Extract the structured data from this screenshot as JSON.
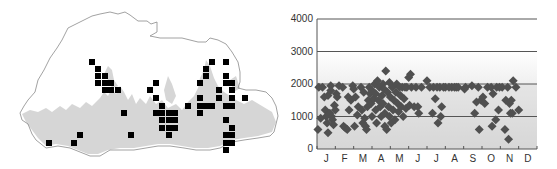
{
  "map": {
    "outline_color": "#8a8a8a",
    "forest_color": "#d6d6d6",
    "marker_color": "#000000",
    "marker_size": 6,
    "records": [
      [
        92,
        62
      ],
      [
        98,
        69
      ],
      [
        98,
        76
      ],
      [
        105,
        76
      ],
      [
        98,
        83
      ],
      [
        105,
        83
      ],
      [
        111,
        83
      ],
      [
        105,
        90
      ],
      [
        111,
        90
      ],
      [
        118,
        90
      ],
      [
        124,
        113
      ],
      [
        131,
        135
      ],
      [
        80,
        135
      ],
      [
        74,
        143
      ],
      [
        49,
        143
      ],
      [
        156,
        83
      ],
      [
        150,
        90
      ],
      [
        156,
        98
      ],
      [
        162,
        106
      ],
      [
        156,
        113
      ],
      [
        162,
        113
      ],
      [
        169,
        113
      ],
      [
        175,
        113
      ],
      [
        162,
        120
      ],
      [
        169,
        120
      ],
      [
        175,
        120
      ],
      [
        162,
        128
      ],
      [
        169,
        128
      ],
      [
        175,
        128
      ],
      [
        169,
        135
      ],
      [
        188,
        106
      ],
      [
        212,
        62
      ],
      [
        226,
        62
      ],
      [
        206,
        69
      ],
      [
        206,
        76
      ],
      [
        226,
        76
      ],
      [
        200,
        83
      ],
      [
        226,
        83
      ],
      [
        232,
        83
      ],
      [
        219,
        90
      ],
      [
        232,
        90
      ],
      [
        200,
        98
      ],
      [
        219,
        98
      ],
      [
        232,
        98
      ],
      [
        245,
        98
      ],
      [
        200,
        106
      ],
      [
        206,
        106
      ],
      [
        212,
        106
      ],
      [
        226,
        106
      ],
      [
        232,
        106
      ],
      [
        200,
        113
      ],
      [
        226,
        120
      ],
      [
        232,
        128
      ],
      [
        226,
        135
      ],
      [
        232,
        135
      ],
      [
        226,
        143
      ],
      [
        232,
        143
      ],
      [
        226,
        150
      ]
    ]
  },
  "chart_data": {
    "type": "scatter",
    "title": "",
    "xlabel": "",
    "ylabel": "",
    "categories": [
      "J",
      "F",
      "M",
      "A",
      "M",
      "J",
      "J",
      "A",
      "S",
      "O",
      "N",
      "D"
    ],
    "yticks": [
      0,
      1000,
      2000,
      3000,
      4000
    ],
    "ylim": [
      0,
      4000
    ],
    "xlim": [
      0,
      12
    ],
    "grid": {
      "y": [
        1000,
        2000,
        3000,
        4000
      ],
      "color": "#555555"
    },
    "background_gradient": {
      "top": "#ffffff",
      "bottom": "#d0d0d0",
      "from_value": 3000
    },
    "band_below_2000": "#dcdcdc",
    "marker": {
      "shape": "diamond",
      "color": "#505050",
      "size": 9
    },
    "series": [
      {
        "name": "records",
        "points": [
          [
            0.05,
            600
          ],
          [
            0.1,
            1900
          ],
          [
            0.2,
            950
          ],
          [
            0.3,
            1900
          ],
          [
            0.4,
            1600
          ],
          [
            0.45,
            1200
          ],
          [
            0.5,
            1000
          ],
          [
            0.55,
            800
          ],
          [
            0.6,
            1650
          ],
          [
            0.6,
            500
          ],
          [
            0.7,
            1100
          ],
          [
            0.75,
            1950
          ],
          [
            0.75,
            1800
          ],
          [
            0.8,
            1000
          ],
          [
            0.85,
            900
          ],
          [
            0.9,
            750
          ],
          [
            0.95,
            1350
          ],
          [
            1.0,
            1200
          ],
          [
            1.05,
            1700
          ],
          [
            1.1,
            1600
          ],
          [
            1.2,
            1950
          ],
          [
            1.4,
            1900
          ],
          [
            1.45,
            700
          ],
          [
            1.55,
            650
          ],
          [
            1.65,
            600
          ],
          [
            1.7,
            1600
          ],
          [
            1.75,
            1200
          ],
          [
            1.85,
            1500
          ],
          [
            1.95,
            1950
          ],
          [
            2.0,
            1850
          ],
          [
            2.05,
            700
          ],
          [
            2.1,
            1600
          ],
          [
            2.2,
            1050
          ],
          [
            2.25,
            1300
          ],
          [
            2.4,
            1900
          ],
          [
            2.45,
            1200
          ],
          [
            2.5,
            800
          ],
          [
            2.55,
            1750
          ],
          [
            2.6,
            950
          ],
          [
            2.65,
            700
          ],
          [
            2.7,
            600
          ],
          [
            2.75,
            1300
          ],
          [
            2.8,
            1500
          ],
          [
            2.85,
            1900
          ],
          [
            2.9,
            1700
          ],
          [
            2.95,
            1400
          ],
          [
            3.0,
            1000
          ],
          [
            3.0,
            1800
          ],
          [
            3.1,
            1550
          ],
          [
            3.15,
            2000
          ],
          [
            3.2,
            1200
          ],
          [
            3.2,
            1700
          ],
          [
            3.25,
            800
          ],
          [
            3.3,
            2100
          ],
          [
            3.35,
            1500
          ],
          [
            3.4,
            1900
          ],
          [
            3.45,
            1300
          ],
          [
            3.5,
            1000
          ],
          [
            3.55,
            1650
          ],
          [
            3.6,
            2000
          ],
          [
            3.6,
            1400
          ],
          [
            3.65,
            1850
          ],
          [
            3.7,
            700
          ],
          [
            3.7,
            1100
          ],
          [
            3.75,
            2400
          ],
          [
            3.8,
            600
          ],
          [
            3.85,
            1750
          ],
          [
            3.9,
            1300
          ],
          [
            3.95,
            2050
          ],
          [
            3.95,
            1000
          ],
          [
            4.0,
            1600
          ],
          [
            4.05,
            800
          ],
          [
            4.1,
            1900
          ],
          [
            4.15,
            1200
          ],
          [
            4.2,
            1500
          ],
          [
            4.25,
            900
          ],
          [
            4.3,
            1750
          ],
          [
            4.35,
            2000
          ],
          [
            4.4,
            1400
          ],
          [
            4.45,
            1150
          ],
          [
            4.5,
            1900
          ],
          [
            4.55,
            1650
          ],
          [
            4.6,
            1300
          ],
          [
            4.65,
            1900
          ],
          [
            4.7,
            1000
          ],
          [
            4.75,
            1550
          ],
          [
            4.8,
            1900
          ],
          [
            4.85,
            1250
          ],
          [
            4.9,
            1900
          ],
          [
            5.0,
            2200
          ],
          [
            5.05,
            1350
          ],
          [
            5.1,
            2300
          ],
          [
            5.15,
            1900
          ],
          [
            5.3,
            1300
          ],
          [
            5.4,
            1900
          ],
          [
            5.5,
            1300
          ],
          [
            5.55,
            1100
          ],
          [
            5.7,
            1900
          ],
          [
            6.0,
            2100
          ],
          [
            6.15,
            1900
          ],
          [
            6.3,
            1100
          ],
          [
            6.35,
            1900
          ],
          [
            6.45,
            1550
          ],
          [
            6.55,
            1900
          ],
          [
            6.6,
            800
          ],
          [
            6.7,
            1900
          ],
          [
            6.75,
            1000
          ],
          [
            6.8,
            1300
          ],
          [
            6.9,
            1900
          ],
          [
            7.0,
            1900
          ],
          [
            7.2,
            1900
          ],
          [
            7.35,
            1900
          ],
          [
            7.5,
            1900
          ],
          [
            7.6,
            1900
          ],
          [
            7.7,
            1900
          ],
          [
            8.05,
            1850
          ],
          [
            8.1,
            1900
          ],
          [
            8.45,
            1950
          ],
          [
            8.6,
            1100
          ],
          [
            8.7,
            1450
          ],
          [
            8.8,
            1900
          ],
          [
            8.85,
            600
          ],
          [
            8.95,
            1500
          ],
          [
            9.05,
            1600
          ],
          [
            9.15,
            1400
          ],
          [
            9.3,
            1900
          ],
          [
            9.5,
            1900
          ],
          [
            9.55,
            700
          ],
          [
            9.6,
            1700
          ],
          [
            9.75,
            900
          ],
          [
            9.8,
            1900
          ],
          [
            9.9,
            1200
          ],
          [
            9.95,
            1900
          ],
          [
            10.1,
            1900
          ],
          [
            10.25,
            600
          ],
          [
            10.3,
            1500
          ],
          [
            10.4,
            1900
          ],
          [
            10.45,
            300
          ],
          [
            10.5,
            1400
          ],
          [
            10.55,
            1100
          ],
          [
            10.6,
            1500
          ],
          [
            10.65,
            1100
          ],
          [
            10.7,
            2100
          ],
          [
            10.85,
            1900
          ],
          [
            11.0,
            1200
          ]
        ]
      }
    ]
  }
}
